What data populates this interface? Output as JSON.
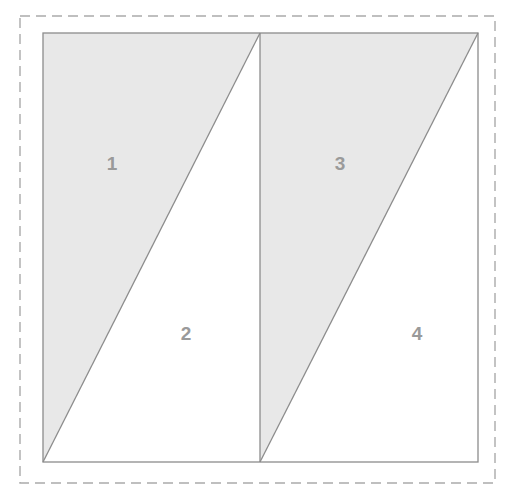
{
  "figure": {
    "title_clipped": "",
    "background_color": "#ffffff",
    "shaded_fill": "#e8e8e8",
    "unshaded_fill": "#ffffff",
    "outline_color": "#8c8c8c",
    "diagonal_color": "#8c8c8c",
    "divider_color": "#8c8c8c",
    "dashed_border_color": "#aaaaaa",
    "label_color": "#9a9a9a"
  },
  "dashed_border": {
    "name": "bounding-box",
    "x": 20,
    "y": 16,
    "width": 475,
    "height": 467,
    "dash_length": 10,
    "gap_length": 6,
    "stroke_width": 1.4
  },
  "squares": [
    {
      "name": "left-square",
      "x": 43,
      "y": 33,
      "width": 217,
      "height": 429
    },
    {
      "name": "right-square",
      "x": 260,
      "y": 33,
      "width": 218,
      "height": 429
    }
  ],
  "regions": [
    {
      "id": "1",
      "label": "1",
      "shaded": true,
      "square": "left",
      "position": "upper-left-triangle",
      "label_x": 112,
      "label_y": 164,
      "points": "43,33 260,33 43,462"
    },
    {
      "id": "2",
      "label": "2",
      "shaded": false,
      "square": "left",
      "position": "lower-right-triangle",
      "label_x": 186,
      "label_y": 334,
      "points": "260,33 260,462 43,462"
    },
    {
      "id": "3",
      "label": "3",
      "shaded": true,
      "square": "right",
      "position": "upper-left-triangle",
      "label_x": 340,
      "label_y": 164,
      "points": "260,33 478,33 260,462"
    },
    {
      "id": "4",
      "label": "4",
      "shaded": false,
      "square": "right",
      "position": "lower-right-triangle",
      "label_x": 417,
      "label_y": 334,
      "points": "478,33 478,462 260,462"
    }
  ],
  "diagonals": [
    {
      "name": "left-square-diagonal",
      "x1": 43,
      "y1": 462,
      "x2": 260,
      "y2": 33
    },
    {
      "name": "right-square-diagonal",
      "x1": 260,
      "y1": 462,
      "x2": 478,
      "y2": 33
    }
  ],
  "divider": {
    "name": "center-vertical-divider",
    "x1": 260,
    "y1": 33,
    "x2": 260,
    "y2": 462
  }
}
